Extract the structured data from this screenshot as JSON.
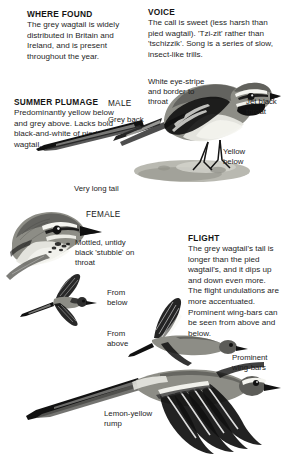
{
  "page": {
    "subject": "Grey Wagtail",
    "background_color": "#ffffff",
    "text_color": "#1a1a1a"
  },
  "sections": {
    "where_found": {
      "heading": "WHERE FOUND",
      "body": "The grey wagtail is widely distributed in Britain and Ireland, and is present throughout the year."
    },
    "voice": {
      "heading": "VOICE",
      "body": "The call is sweet (less harsh than pied wagtail). 'Tzi-zit' rather than 'tschizzik'. Song is a series of slow, insect-like trills."
    },
    "summer_plumage": {
      "heading": "SUMMER PLUMAGE",
      "body": "Predominantly yellow below and grey above. Lacks bold black-and-white of pied wagtail."
    },
    "flight": {
      "heading": "FLIGHT",
      "body": "The grey wagtail's tail is longer than the pied wagtail's, and it dips up and down even more. The flight undulations are more accentuated. Prominent wing-bars can be seen from above and below."
    }
  },
  "figure_tags": {
    "male": "MALE",
    "female": "FEMALE",
    "from_below": "From below",
    "from_above": "From above"
  },
  "callouts": {
    "white_eye_stripe": "White eye-stripe and border to throat",
    "jet_black_throat": "Jet black throat",
    "grey_back": "Grey back",
    "yellow_below": "Yellow below",
    "very_long_tail": "Very long tail",
    "mottled_stubble": "Mottled, untidy black 'stubble' on throat",
    "prominent_wing_bars": "Prominent wing-bars",
    "lemon_yellow_rump": "Lemon-yellow rump"
  },
  "illustrations": {
    "male_perched": "male-grey-wagtail-perched-on-rock",
    "female_head": "female-grey-wagtail-head-and-breast",
    "flight_from_below": "grey-wagtail-in-flight-seen-from-below",
    "flight_from_above": "grey-wagtail-in-flight-seen-from-above",
    "flight_large": "grey-wagtail-in-flight-showing-wing-bars-and-rump"
  }
}
